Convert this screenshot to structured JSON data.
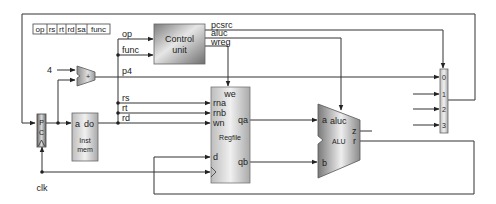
{
  "diagram": {
    "instruction_fields": [
      "op",
      "rs",
      "rt",
      "rd",
      "sa",
      "func"
    ],
    "control_unit": {
      "label_line1": "Control",
      "label_line2": "unit",
      "inputs": [
        "op",
        "func"
      ],
      "outputs": [
        "pcsrc",
        "aluc",
        "wreg"
      ]
    },
    "adder": {
      "constant_input": "4",
      "symbol": "+",
      "output": "p4"
    },
    "pc": {
      "label_chars": [
        "P",
        "C"
      ]
    },
    "inst_mem": {
      "port_a": "a",
      "port_do": "do",
      "label_line1": "Inst",
      "label_line2": "mem"
    },
    "bus_labels": {
      "rs": "rs",
      "rt": "rt",
      "rd": "rd"
    },
    "regfile": {
      "we": "we",
      "rna": "rna",
      "rnb": "rnb",
      "wn": "wn",
      "d": "d",
      "qa": "qa",
      "qb": "qb",
      "label": "Regfile"
    },
    "alu": {
      "a": "a",
      "b": "b",
      "aluc": "aluc",
      "z": "z",
      "r": "r",
      "label": "ALU"
    },
    "mux": {
      "inputs": [
        "0",
        "1",
        "2",
        "3"
      ]
    },
    "clock": "clk",
    "colors": {
      "line": "#333333",
      "box_border": "#555555",
      "block_dark": "#8a8a8a",
      "block_light": "#f2f2f2"
    }
  }
}
